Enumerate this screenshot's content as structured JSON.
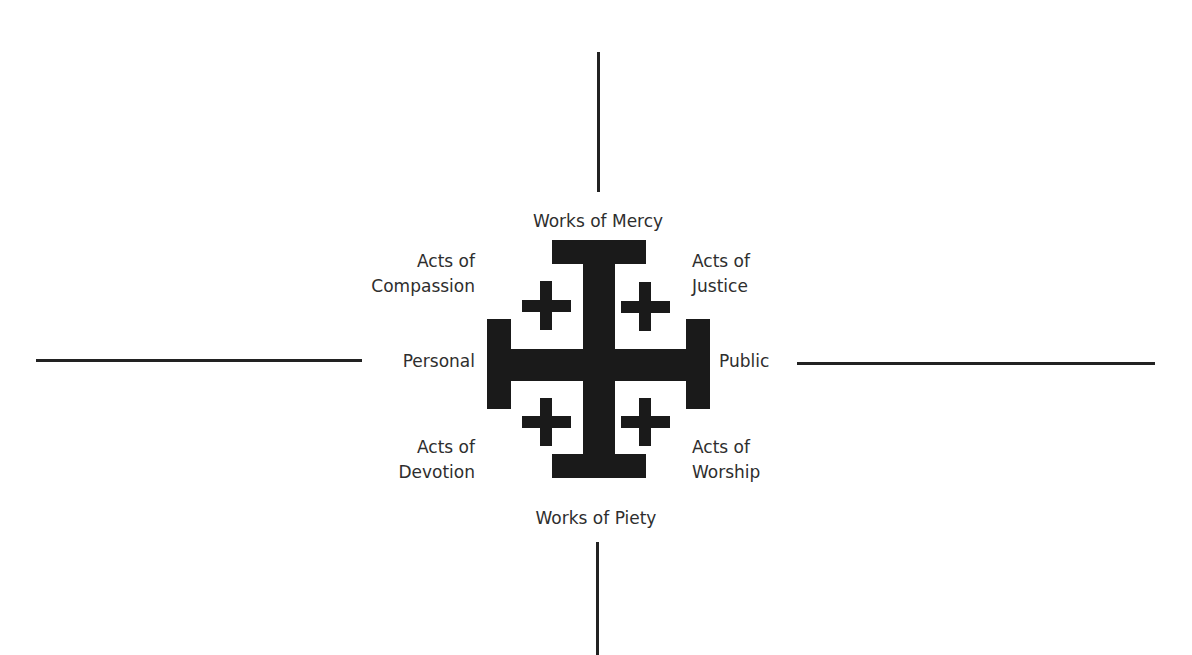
{
  "diagram": {
    "type": "jerusalem-cross-quadrant",
    "top_caption_clipped": "",
    "colors": {
      "ink": "#1a1a1a",
      "text": "#2e2e2e",
      "background": "#ffffff"
    },
    "labels": {
      "top": "Works of Mercy",
      "bottom": "Works of Piety",
      "left": "Personal",
      "right": "Public",
      "top_left": {
        "line1": "Acts of",
        "line2": "Compassion"
      },
      "top_right": {
        "line1": "Acts of",
        "line2": "Justice"
      },
      "bottom_left": {
        "line1": "Acts of",
        "line2": "Devotion"
      },
      "bottom_right": {
        "line1": "Acts of",
        "line2": "Worship"
      }
    },
    "axes": {
      "vertical": {
        "x": 598,
        "top_segment": [
          52,
          192
        ],
        "bottom_segment": [
          542,
          655
        ]
      },
      "horizontal": {
        "y": 360,
        "left_segment": [
          36,
          362
        ],
        "right_segment": [
          797,
          1155
        ]
      }
    },
    "icon": "jerusalem-cross-icon"
  }
}
